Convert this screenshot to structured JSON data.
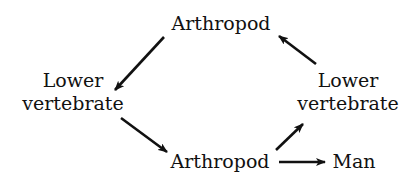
{
  "diagram": {
    "type": "cycle",
    "nodes": {
      "top_arthropod": {
        "lines": [
          "Arthropod"
        ]
      },
      "left_vertebrate": {
        "lines": [
          "Lower",
          "vertebrate"
        ]
      },
      "right_vertebrate": {
        "lines": [
          "Lower",
          "vertebrate"
        ]
      },
      "bottom_arthropod": {
        "lines": [
          "Arthropod"
        ]
      },
      "man": {
        "lines": [
          "Man"
        ]
      }
    },
    "edges": [
      {
        "from": "top_arthropod",
        "to": "left_vertebrate"
      },
      {
        "from": "left_vertebrate",
        "to": "bottom_arthropod"
      },
      {
        "from": "bottom_arthropod",
        "to": "right_vertebrate"
      },
      {
        "from": "right_vertebrate",
        "to": "top_arthropod"
      },
      {
        "from": "bottom_arthropod",
        "to": "man"
      }
    ],
    "colors": {
      "text": "#111111",
      "arrow": "#111111",
      "background": "#ffffff"
    }
  }
}
